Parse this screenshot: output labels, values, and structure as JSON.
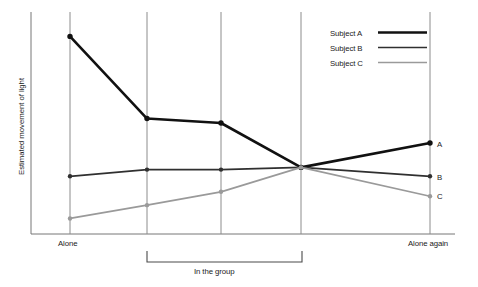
{
  "chart_data": {
    "type": "line",
    "title": "",
    "subtitle": "",
    "xlabel": "",
    "ylabel": "Estimated movement of light",
    "x": [
      "Alone",
      "Session 2",
      "Session 3",
      "Session 4",
      "Alone again"
    ],
    "x_tick_labels": [
      "Alone",
      "",
      "",
      "",
      "Alone again"
    ],
    "y_tick_labels": [],
    "ylim": [
      0,
      100
    ],
    "grid": "vertical-only",
    "legend_position": "top-right",
    "annotations": [
      {
        "name": "group-bracket",
        "text": "In the group",
        "spans_x": [
          "Session 2",
          "Session 4"
        ]
      }
    ],
    "endpoint_labels": [
      "A",
      "B",
      "C"
    ],
    "series": [
      {
        "name": "Subject A",
        "label": "A",
        "color": "#111111",
        "width": 2.6,
        "values": [
          89,
          52,
          50,
          30,
          41
        ]
      },
      {
        "name": "Subject B",
        "label": "B",
        "color": "#303030",
        "width": 1.7,
        "values": [
          26,
          29,
          29,
          30,
          26
        ]
      },
      {
        "name": "Subject C",
        "label": "C",
        "color": "#9a9a9a",
        "width": 1.7,
        "values": [
          7,
          13,
          19,
          30,
          17
        ]
      }
    ]
  },
  "legend": {
    "entries": [
      {
        "label": "Subject A",
        "color": "#111111",
        "width": 2.6
      },
      {
        "label": "Subject B",
        "color": "#303030",
        "width": 1.7
      },
      {
        "label": "Subject C",
        "color": "#9a9a9a",
        "width": 1.7
      }
    ]
  },
  "axis": {
    "y_title": "Estimated movement of light",
    "x_left_label": "Alone",
    "x_right_label": "Alone again"
  },
  "bracket": {
    "label": "In the group"
  },
  "endpoints": {
    "a": "A",
    "b": "B",
    "c": "C"
  },
  "colors": {
    "axis": "#777777",
    "gridline": "#8c8c8c",
    "series_a": "#111111",
    "series_b": "#303030",
    "series_c": "#9a9a9a",
    "text": "#1b1b1b"
  }
}
